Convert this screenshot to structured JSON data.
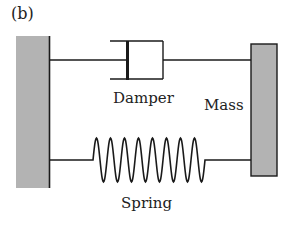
{
  "panel_label": "(b)",
  "labels": {
    "damper": "Damper",
    "mass": "Mass",
    "spring": "Spring"
  },
  "colors": {
    "wall_fill": "#b3b3b3",
    "mass_fill": "#b3b3b3",
    "stroke": "#1a1a1a"
  },
  "spring": {
    "coils": 8
  }
}
